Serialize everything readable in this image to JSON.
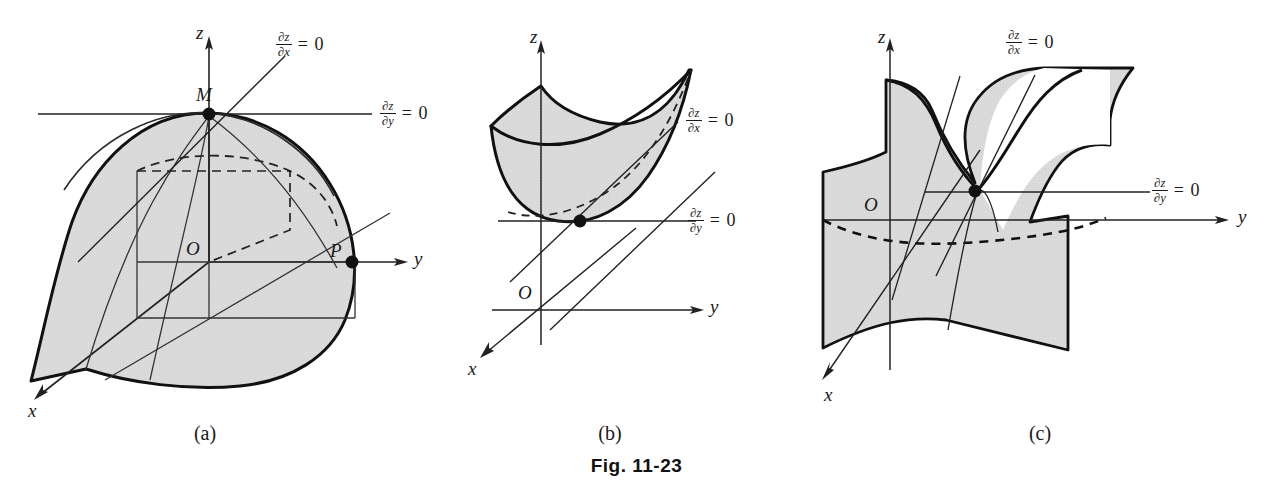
{
  "figure": {
    "caption": "Fig. 11-23",
    "panels": [
      {
        "id": "a",
        "sublabel": "(a)",
        "type": "relative-maximum-surface",
        "axes": {
          "x": "x",
          "y": "y",
          "z": "z",
          "origin": "O"
        },
        "points": [
          {
            "name": "M",
            "label": "M",
            "role": "maximum-point"
          },
          {
            "name": "P",
            "label": "P",
            "role": "boundary-point"
          }
        ],
        "annotations": [
          {
            "name": "dz-dx",
            "num": "∂z",
            "den": "∂x",
            "equals": "= 0"
          },
          {
            "name": "dz-dy",
            "num": "∂z",
            "den": "∂y",
            "equals": "= 0"
          }
        ]
      },
      {
        "id": "b",
        "sublabel": "(b)",
        "type": "relative-minimum-surface",
        "axes": {
          "x": "x",
          "y": "y",
          "z": "z",
          "origin": "O"
        },
        "points": [
          {
            "name": "minimum",
            "label": "",
            "role": "minimum-point"
          }
        ],
        "annotations": [
          {
            "name": "dz-dx",
            "num": "∂z",
            "den": "∂x",
            "equals": "= 0"
          },
          {
            "name": "dz-dy",
            "num": "∂z",
            "den": "∂y",
            "equals": "= 0"
          }
        ]
      },
      {
        "id": "c",
        "sublabel": "(c)",
        "type": "saddle-point-surface",
        "axes": {
          "x": "x",
          "y": "y",
          "z": "z",
          "origin": "O"
        },
        "points": [
          {
            "name": "saddle",
            "label": "",
            "role": "saddle-point"
          }
        ],
        "annotations": [
          {
            "name": "dz-dx",
            "num": "∂z",
            "den": "∂x",
            "equals": "= 0"
          },
          {
            "name": "dz-dy",
            "num": "∂z",
            "den": "∂y",
            "equals": "= 0"
          }
        ]
      }
    ]
  },
  "colors": {
    "surface_fill": "#d9d9d9",
    "stroke": "#1a1a1a",
    "thin_stroke": "#3a3a3a",
    "background": "#ffffff"
  }
}
